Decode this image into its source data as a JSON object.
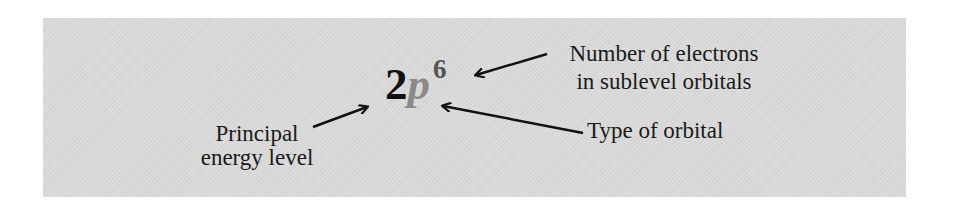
{
  "diagram": {
    "notation": {
      "principal_level": "2",
      "orbital_type": "p",
      "electron_count": "6",
      "colors": {
        "principal_level": "#111111",
        "orbital_type": "#8a8a8a",
        "electron_count": "#555555"
      }
    },
    "labels": {
      "principal": [
        "Principal",
        "energy level"
      ],
      "electrons": [
        "Number of electrons",
        "in sublevel orbitals"
      ],
      "orbital": [
        "Type of orbital"
      ]
    },
    "background_color": "#dadada"
  }
}
